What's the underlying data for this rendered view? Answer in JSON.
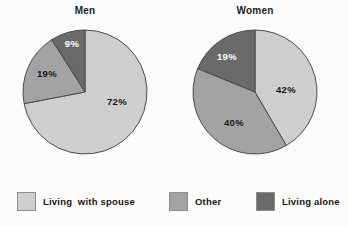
{
  "figure": {
    "background_color": "#fcfcfc"
  },
  "palette": {
    "living_with_spouse": "#cecece",
    "other": "#a3a3a3",
    "living_alone": "#6a6a6a",
    "slice_border": "#4a4a4a",
    "label_dark": "#171717",
    "label_light": "#ffffff"
  },
  "legend": {
    "position": "bottom",
    "items": [
      {
        "label": "Living  with spouse",
        "color": "#cecece",
        "swatch_name": "legend-swatch-living-with-spouse"
      },
      {
        "label": "Other",
        "color": "#a3a3a3",
        "swatch_name": "legend-swatch-other"
      },
      {
        "label": "Living alone",
        "color": "#6a6a6a",
        "swatch_name": "legend-swatch-living-alone"
      }
    ]
  },
  "charts": [
    {
      "id": "men",
      "title": "Men",
      "center": {
        "cx": 65,
        "cy": 65
      },
      "radius": 62,
      "start_angle_deg": 0,
      "slices": [
        {
          "name": "Living  with spouse",
          "value": 72,
          "label": "72%",
          "color": "#cecece",
          "label_color": "#171717",
          "label_pos": {
            "x": 97,
            "y": 75
          }
        },
        {
          "name": "Other",
          "value": 19,
          "label": "19%",
          "color": "#a3a3a3",
          "label_color": "#171717",
          "label_pos": {
            "x": 27,
            "y": 47
          }
        },
        {
          "name": "Living alone",
          "value": 9,
          "label": "9%",
          "color": "#6a6a6a",
          "label_color": "#ffffff",
          "label_pos": {
            "x": 52,
            "y": 17
          }
        }
      ]
    },
    {
      "id": "women",
      "title": "Women",
      "center": {
        "cx": 65,
        "cy": 65
      },
      "radius": 62,
      "start_angle_deg": 0,
      "slices": [
        {
          "name": "Living  with spouse",
          "value": 42,
          "label": "42%",
          "color": "#cecece",
          "label_color": "#171717",
          "label_pos": {
            "x": 96,
            "y": 63
          }
        },
        {
          "name": "Other",
          "value": 40,
          "label": "40%",
          "color": "#a3a3a3",
          "label_color": "#171717",
          "label_pos": {
            "x": 44,
            "y": 96
          }
        },
        {
          "name": "Living alone",
          "value": 19,
          "label": "19%",
          "color": "#6a6a6a",
          "label_color": "#ffffff",
          "label_pos": {
            "x": 37,
            "y": 30
          }
        }
      ]
    }
  ],
  "chart_data": {
    "type": "pie",
    "title": "",
    "subtitle": "",
    "xlabel": "",
    "ylabel": "",
    "grid": false,
    "legend_position": "bottom",
    "legend_entries": [
      "Living  with spouse",
      "Other",
      "Living alone"
    ],
    "units": "percent",
    "panels": [
      {
        "title": "Men",
        "labels": [
          "Living  with spouse",
          "Other",
          "Living alone"
        ],
        "values": [
          72,
          19,
          9
        ],
        "data_labels": [
          "72%",
          "19%",
          "9%"
        ],
        "colors": [
          "#cecece",
          "#a3a3a3",
          "#6a6a6a"
        ]
      },
      {
        "title": "Women",
        "labels": [
          "Living  with spouse",
          "Other",
          "Living alone"
        ],
        "values": [
          42,
          40,
          19
        ],
        "data_labels": [
          "42%",
          "40%",
          "19%"
        ],
        "colors": [
          "#cecece",
          "#a3a3a3",
          "#6a6a6a"
        ]
      }
    ]
  }
}
